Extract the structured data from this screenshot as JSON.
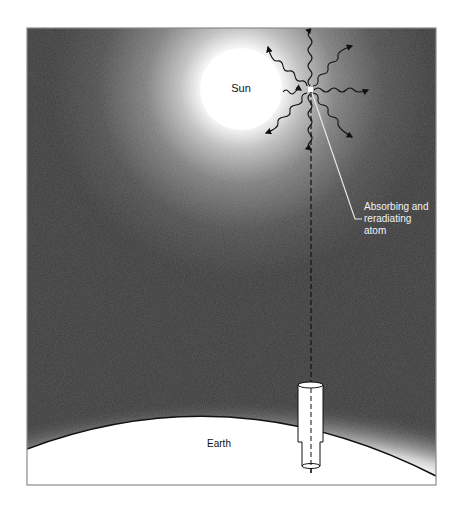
{
  "figure": {
    "labels": {
      "sun": "Sun",
      "earth": "Earth",
      "atom_line1": "Absorbing and",
      "atom_line2": "reradiating",
      "atom_line3": "atom"
    },
    "colors": {
      "sky_dark": "#383838",
      "glow": "#ffffff",
      "line": "#111111",
      "leader": "#e8e8e8",
      "frame": "#8a8a8a"
    },
    "components": [
      "sun",
      "absorbing-reradiating-atom",
      "reradiated-photon-arrows",
      "line-of-sight-dashed",
      "telescope",
      "earth-surface",
      "atmosphere-glow"
    ]
  }
}
